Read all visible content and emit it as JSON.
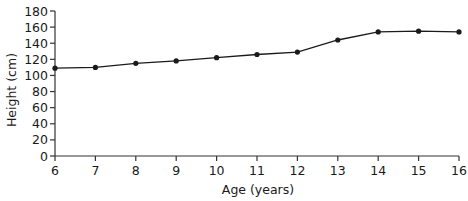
{
  "chart_data": {
    "type": "line",
    "title": "",
    "xlabel": "Age (years)",
    "ylabel": "Height (cm)",
    "x": [
      6,
      7,
      8,
      9,
      10,
      11,
      12,
      13,
      14,
      15,
      16
    ],
    "series": [
      {
        "name": "Height",
        "values": [
          109,
          110,
          115,
          118,
          122,
          126,
          129,
          144,
          154,
          155,
          154
        ],
        "marker": "circle",
        "color": "#1a1a1a"
      }
    ],
    "xlim": [
      6,
      16
    ],
    "ylim": [
      0,
      180
    ],
    "xticks": [
      6,
      7,
      8,
      9,
      10,
      11,
      12,
      13,
      14,
      15,
      16
    ],
    "yticks": [
      0,
      20,
      40,
      60,
      80,
      100,
      120,
      140,
      160,
      180
    ],
    "grid": false,
    "legend": null
  },
  "colors": {
    "axis": "#333333",
    "line": "#1a1a1a",
    "background": "#ffffff"
  }
}
